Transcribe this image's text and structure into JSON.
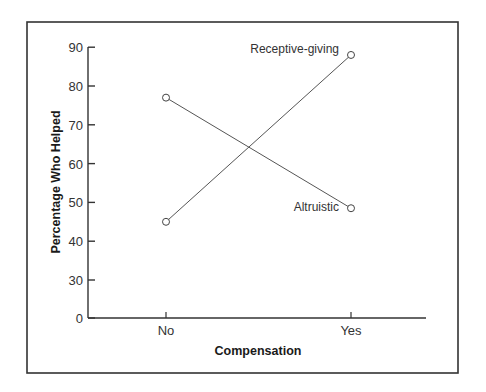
{
  "chart_data": {
    "type": "line",
    "title": "",
    "xlabel": "Compensation",
    "ylabel": "Percentage Who Helped",
    "categories": [
      "No",
      "Yes"
    ],
    "series": [
      {
        "name": "Altruistic",
        "values": [
          77,
          48.5
        ]
      },
      {
        "name": "Receptive-giving",
        "values": [
          45,
          88
        ]
      }
    ],
    "y_ticks": [
      0,
      30,
      40,
      50,
      60,
      70,
      80,
      90
    ],
    "ylim": [
      0,
      90
    ],
    "y_axis_break": "scale jumps from 0 to 30",
    "grid": false,
    "legend": "inline labels next to series endpoints",
    "marker": "open circle"
  },
  "colors": {
    "line": "#555555",
    "frame": "#333333",
    "axis": "#333333"
  }
}
